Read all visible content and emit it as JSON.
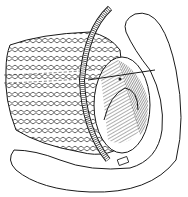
{
  "image": {
    "type": "line-art illustration",
    "subject": "surgical anatomy illustration with tube",
    "colors": {
      "background": "#ffffff",
      "ink": "#1a1a1a",
      "hatch": "#333333"
    }
  }
}
